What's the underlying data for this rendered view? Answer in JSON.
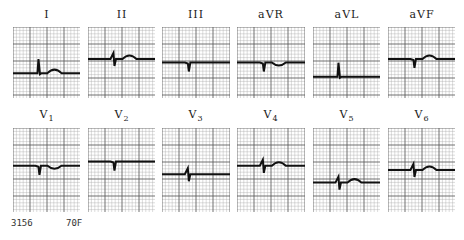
{
  "leads_row1": [
    {
      "label": "I",
      "x": 13,
      "y": 27,
      "w": 67,
      "h": 71,
      "baseline": 0.65,
      "qrs": "up",
      "t": "up"
    },
    {
      "label": "II",
      "x": 88,
      "y": 27,
      "w": 67,
      "h": 71,
      "baseline": 0.45,
      "qrs": "biphasic",
      "t": "up"
    },
    {
      "label": "III",
      "x": 162,
      "y": 27,
      "w": 68,
      "h": 71,
      "baseline": 0.5,
      "qrs": "down",
      "t": "flat"
    },
    {
      "label": "aVR",
      "x": 237,
      "y": 27,
      "w": 68,
      "h": 71,
      "baseline": 0.5,
      "qrs": "down",
      "t": "down"
    },
    {
      "label": "aVL",
      "x": 313,
      "y": 27,
      "w": 67,
      "h": 71,
      "baseline": 0.7,
      "qrs": "up",
      "t": "flat"
    },
    {
      "label": "aVF",
      "x": 388,
      "y": 27,
      "w": 67,
      "h": 71,
      "baseline": 0.45,
      "qrs": "down",
      "t": "up"
    }
  ],
  "leads_row2": [
    {
      "label": "V",
      "sub": "1",
      "x": 13,
      "y": 128,
      "w": 67,
      "h": 84,
      "baseline": 0.45,
      "qrs": "down",
      "t": "down"
    },
    {
      "label": "V",
      "sub": "2",
      "x": 88,
      "y": 128,
      "w": 67,
      "h": 84,
      "baseline": 0.4,
      "qrs": "down",
      "t": "flat"
    },
    {
      "label": "V",
      "sub": "3",
      "x": 162,
      "y": 128,
      "w": 68,
      "h": 84,
      "baseline": 0.55,
      "qrs": "biphasic",
      "t": "flat"
    },
    {
      "label": "V",
      "sub": "4",
      "x": 237,
      "y": 128,
      "w": 68,
      "h": 84,
      "baseline": 0.45,
      "qrs": "biphasic",
      "t": "up"
    },
    {
      "label": "V",
      "sub": "5",
      "x": 313,
      "y": 128,
      "w": 67,
      "h": 84,
      "baseline": 0.65,
      "qrs": "biphasic",
      "t": "up"
    },
    {
      "label": "V",
      "sub": "6",
      "x": 388,
      "y": 128,
      "w": 67,
      "h": 84,
      "baseline": 0.5,
      "qrs": "biphasic",
      "t": "up"
    }
  ],
  "caption": {
    "id": "3156",
    "patient": "70F"
  },
  "colors": {
    "grid": "#555555",
    "grid_minor": "#aaaaaa",
    "trace": "#111111"
  }
}
